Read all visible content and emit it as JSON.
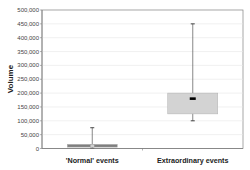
{
  "chart_data": {
    "type": "boxplot",
    "title": "",
    "xlabel": "",
    "ylabel": "Volume",
    "ylim": [
      0,
      500000
    ],
    "yticks": [
      0,
      50000,
      100000,
      150000,
      200000,
      250000,
      300000,
      350000,
      400000,
      450000,
      500000
    ],
    "ytick_labels": [
      "0",
      "50,000",
      "100,000",
      "150,000",
      "200,000",
      "250,000",
      "300,000",
      "350,000",
      "400,000",
      "450,000",
      "500,000"
    ],
    "grid": true,
    "legend": null,
    "categories": [
      "'Normal' events",
      "Extraordinary events"
    ],
    "series": [
      {
        "name": "'Normal' events",
        "min": 0,
        "q1": 5000,
        "median": 10000,
        "q3": 15000,
        "max": 75000,
        "box_color": "#7f7f7f"
      },
      {
        "name": "Extraordinary events",
        "min": 100000,
        "q1": 125000,
        "median": 180000,
        "q3": 200000,
        "max": 450000,
        "box_color": "#d3d3d3"
      }
    ]
  },
  "colors": {
    "gridline": "#e6e6e6",
    "axis": "#808080",
    "whisker": "#555555",
    "median_marker": "#000000"
  }
}
